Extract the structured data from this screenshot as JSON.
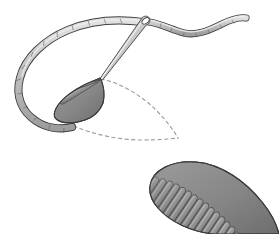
{
  "figure": {
    "domain_kind": "illustration",
    "title": "",
    "caption": "",
    "background_color": "#ffffff",
    "canvas": {
      "width": 279,
      "height": 234
    }
  },
  "palette": {
    "thread_fill": "#b9b9b9",
    "thread_fill_light": "#d6d6d6",
    "thread_outline": "#3d3d3d",
    "needle_fill": "#cfcfcf",
    "needle_highlight": "#f0f0f0",
    "needle_outline": "#4a4a4a",
    "stitch_fill": "#8a8a8a",
    "stitch_fill_dark": "#6f6f6f",
    "stitch_line": "#4a4a4a",
    "stitch_outline": "#3a3a3a",
    "guide_dash": "#8c8c99",
    "background": "#ffffff"
  },
  "elements": {
    "working_thread": {
      "label": "working-thread-loop",
      "description": "Large open loop of thread curving from the needle eye down around the left and under the partially worked stitch block."
    },
    "thread_tail": {
      "label": "thread-tail",
      "description": "Wavy free end of thread extending to the right from the needle eye."
    },
    "needle": {
      "label": "sewing-needle",
      "description": "Tapered needle angled from upper right down to lower left, piercing the fabric at the stitch block.",
      "eye_position": [
        146,
        22
      ],
      "tip_position": [
        100,
        78
      ]
    },
    "partial_stitch_block": {
      "label": "partial-satin-stitch-block",
      "description": "Partly completed fan of slanted satin stitches radiating from the needle entry point.",
      "stitch_count": 8
    },
    "guide_outline": {
      "label": "dashed-leaf-guide",
      "description": "Dashed guideline showing the outline of the leaf shape still to be filled.",
      "tip_point": [
        178,
        138
      ]
    },
    "finished_leaf": {
      "label": "finished-satin-stitch-leaf",
      "description": "Completed leaf shape densely filled with slanted satin stitches, tapering off the lower right edge.",
      "stitch_count": 22
    }
  },
  "annotations": {
    "items": []
  }
}
